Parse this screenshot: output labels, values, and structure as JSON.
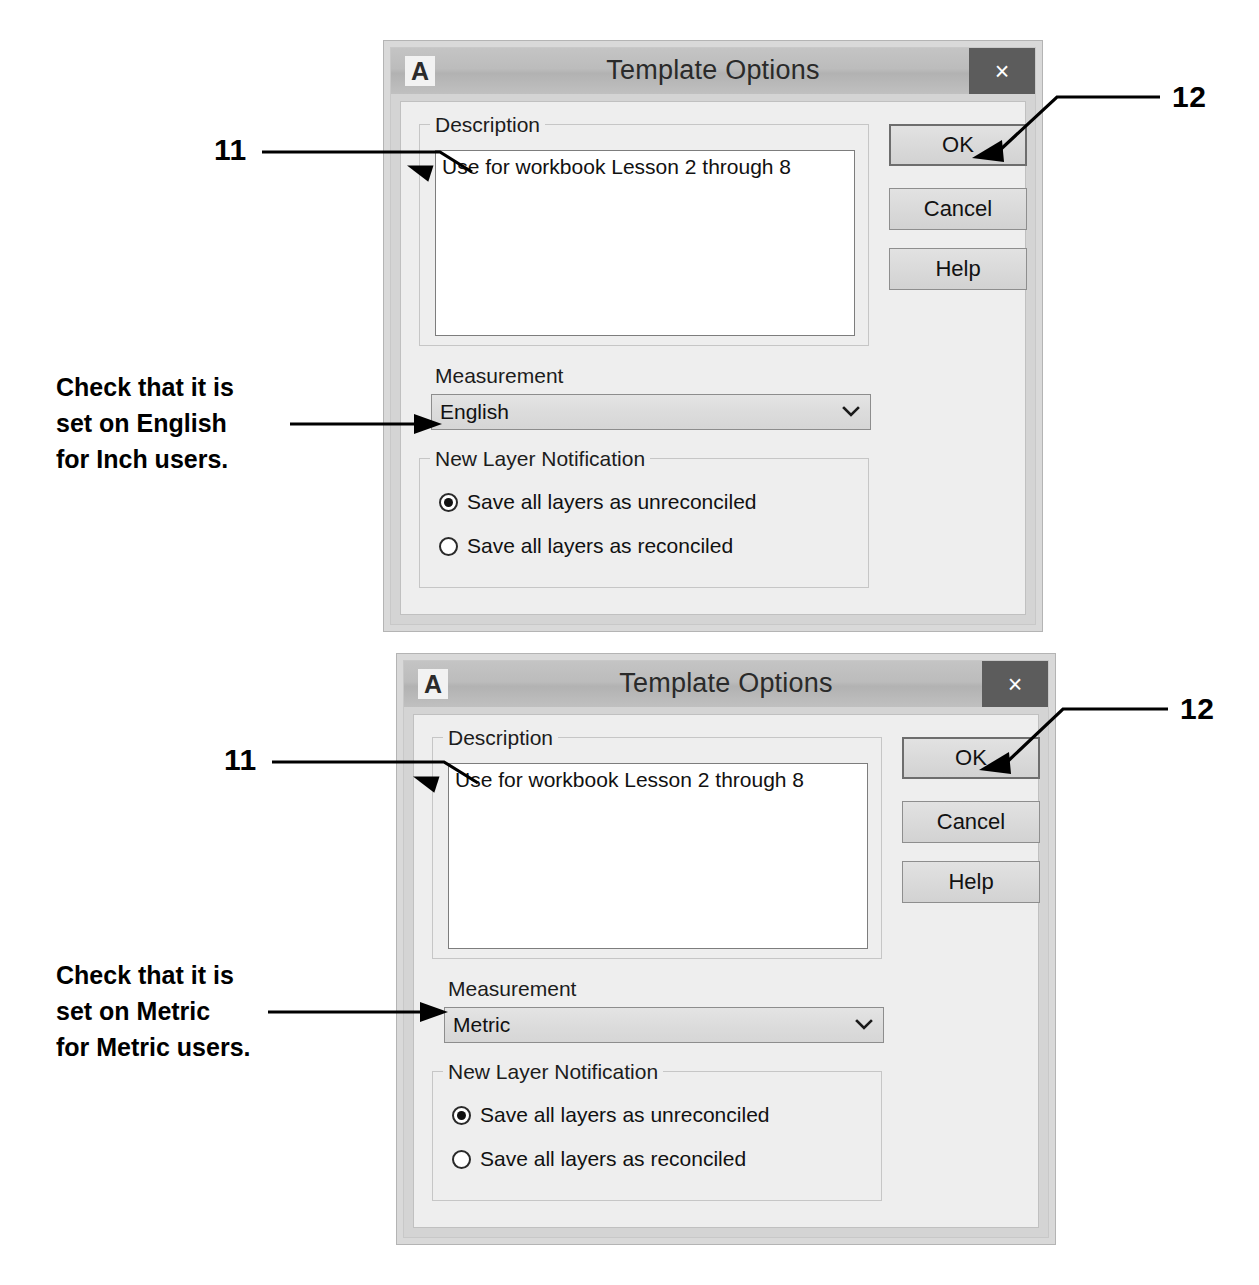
{
  "dialogs": [
    {
      "id": "dialog-english",
      "title": "Template Options",
      "logo_letter": "A",
      "close_glyph": "×",
      "description": {
        "group_label": "Description",
        "value": "Use for workbook Lesson 2 through 8"
      },
      "measurement": {
        "label": "Measurement",
        "value": "English",
        "options": [
          "English",
          "Metric"
        ]
      },
      "new_layer_notification": {
        "group_label": "New Layer Notification",
        "options": [
          {
            "label": "Save all layers as unreconciled",
            "selected": true
          },
          {
            "label": "Save all layers as reconciled",
            "selected": false
          }
        ]
      },
      "buttons": [
        {
          "label": "OK",
          "default": true
        },
        {
          "label": "Cancel",
          "default": false
        },
        {
          "label": "Help",
          "default": false
        }
      ]
    },
    {
      "id": "dialog-metric",
      "title": "Template Options",
      "logo_letter": "A",
      "close_glyph": "×",
      "description": {
        "group_label": "Description",
        "value": "Use for workbook Lesson 2 through 8"
      },
      "measurement": {
        "label": "Measurement",
        "value": "Metric",
        "options": [
          "English",
          "Metric"
        ]
      },
      "new_layer_notification": {
        "group_label": "New Layer Notification",
        "options": [
          {
            "label": "Save all layers as unreconciled",
            "selected": true
          },
          {
            "label": "Save all layers as reconciled",
            "selected": false
          }
        ]
      },
      "buttons": [
        {
          "label": "OK",
          "default": true
        },
        {
          "label": "Cancel",
          "default": false
        },
        {
          "label": "Help",
          "default": false
        }
      ]
    }
  ],
  "annotations": {
    "callout_11_top": "11",
    "callout_12_top": "12",
    "callout_11_bottom": "11",
    "callout_12_bottom": "12",
    "note_top_line1": "Check that it is",
    "note_top_line2": "set on English",
    "note_top_line3": "for Inch users.",
    "note_bottom_line1": "Check that it is",
    "note_bottom_line2": "set on Metric",
    "note_bottom_line3": "for Metric users."
  },
  "colors": {
    "annotation": "#000000",
    "titlebar": "#bcbcbc",
    "close_button": "#5c5c5c",
    "dialog_face": "#eeeeee",
    "dialog_frame": "#d9d9d9"
  }
}
